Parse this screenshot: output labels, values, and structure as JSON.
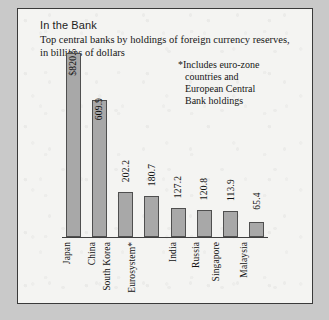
{
  "chart_data": {
    "type": "bar",
    "title": "In the Bank",
    "subtitle": "Top central banks by holdings of foreign currency reserves, in billions of dollars",
    "footnote_lines": [
      "*Includes euro-zone",
      "countries and",
      "European Central",
      "Bank holdings"
    ],
    "categories": [
      "Japan",
      "China",
      "South Korea",
      "Eurosystem*",
      "India",
      "Russia",
      "Singapore",
      "Malaysia"
    ],
    "values": [
      820.5,
      609.9,
      202.2,
      180.7,
      127.2,
      120.8,
      113.9,
      65.4
    ],
    "value_labels": [
      "$820.5",
      "609.9",
      "202.2",
      "180.7",
      "127.2",
      "120.8",
      "113.9",
      "65.4"
    ],
    "label_placement": [
      "inside",
      "inside",
      "outside",
      "outside",
      "outside",
      "outside",
      "outside",
      "outside"
    ],
    "xlabel": "",
    "ylabel": "",
    "ylim": [
      0,
      820.5
    ],
    "grid": false,
    "legend": "none",
    "bar_color": "#a8a8a8",
    "bar_edge_color": "#4f4f4f",
    "panel_background": "#f4f4f2",
    "panel_border_color": "#3a3a3a",
    "page_background": "#c9c9c9",
    "text_color": "#111111"
  }
}
